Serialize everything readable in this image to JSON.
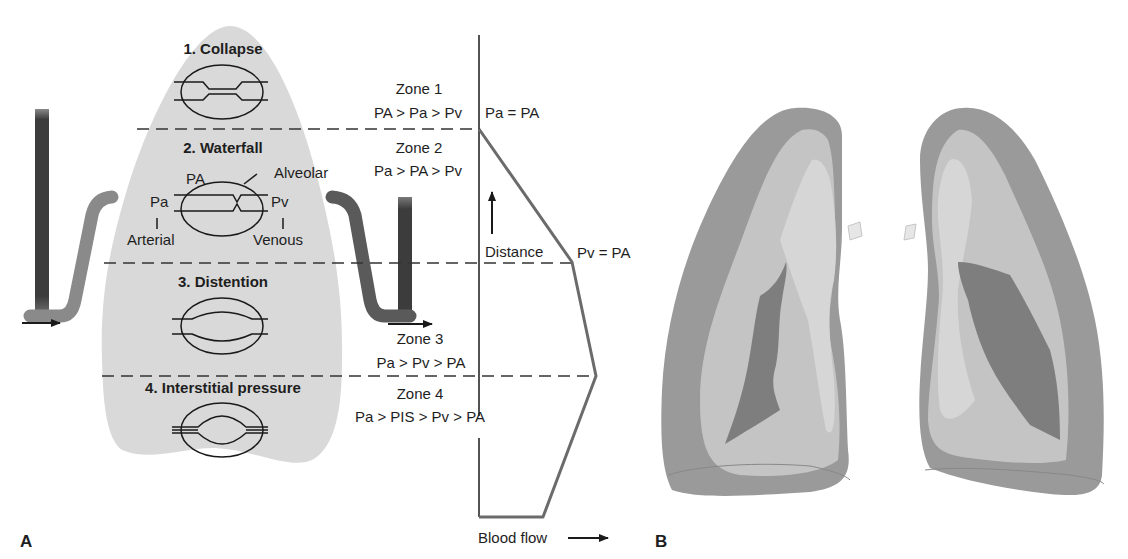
{
  "panel_a": {
    "label": "A",
    "regions": [
      {
        "title": "1. Collapse"
      },
      {
        "title": "2. Waterfall"
      },
      {
        "title": "3. Distention"
      },
      {
        "title": "4. Interstitial pressure"
      }
    ],
    "vessel_labels": {
      "pa": "Pa",
      "pv": "Pv",
      "PA": "PA",
      "alveolar": "Alveolar",
      "arterial": "Arterial",
      "venous": "Venous"
    },
    "zones": [
      {
        "name": "Zone 1",
        "relation": "PA > Pa > Pv"
      },
      {
        "name": "Zone 2",
        "relation": "Pa > PA > Pv"
      },
      {
        "name": "Zone 3",
        "relation": "Pa > Pv > PA"
      },
      {
        "name": "Zone 4",
        "relation": "Pa > PIS > Pv > PA"
      }
    ],
    "graph": {
      "marker_top": "Pa = PA",
      "marker_mid": "Pv = PA",
      "y_axis_label": "Distance",
      "x_axis_label": "Blood flow"
    }
  },
  "panel_b": {
    "label": "B"
  },
  "colors": {
    "lung_fill": "#d9d9d9",
    "tube_light": "#8a8a8a",
    "tube_dark": "#3a3a3a",
    "line": "#1a1a1a",
    "flow_curve": "#6b6b6b",
    "lung_outer": "#9a9a9a",
    "lung_mid": "#c4c4c4",
    "lung_inner": "#d6d6d6",
    "lung_core": "#7e7e7e"
  }
}
